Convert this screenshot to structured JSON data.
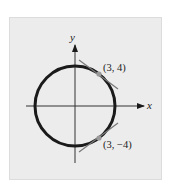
{
  "figure": {
    "axes": {
      "x_label": "x",
      "y_label": "y"
    },
    "circle": {
      "equation": "x^2 + y^2 = 25",
      "radius": 5
    },
    "points": [
      {
        "label": "(3, 4)",
        "x": 3,
        "y": 4
      },
      {
        "label": "(3, −4)",
        "x": 3,
        "y": -4
      }
    ],
    "colors": {
      "panel": "#ececec",
      "circle": "#1a1a1a",
      "tangent": "#7a7a7a",
      "point": "#9a9a9a"
    }
  }
}
